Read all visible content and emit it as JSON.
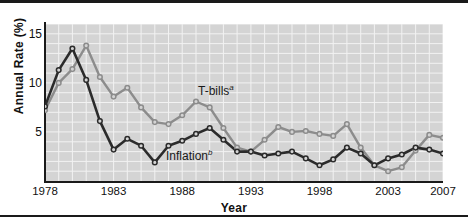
{
  "figure": {
    "background": "#ffffff",
    "plot_background": "#d4d4d4",
    "grid_color": "#f2f2f2"
  },
  "annotations": {
    "tbills": {
      "text": "T-bills",
      "sup": "a",
      "x": 198,
      "y": 80
    },
    "inflation": {
      "text": "Inflation",
      "sup": "b",
      "x": 166,
      "y": 145
    }
  },
  "chart_data": {
    "type": "line",
    "title": "",
    "xlabel": "Year",
    "ylabel": "Annual Rate (%)",
    "xlim": [
      1978,
      2007
    ],
    "ylim": [
      0,
      16
    ],
    "yticks": [
      5,
      10,
      15
    ],
    "xticks": [
      1978,
      1983,
      1988,
      1993,
      1998,
      2003,
      2007
    ],
    "grid": true,
    "legend": "inline-annotations",
    "x": [
      1978,
      1979,
      1980,
      1981,
      1982,
      1983,
      1984,
      1985,
      1986,
      1987,
      1988,
      1989,
      1990,
      1991,
      1992,
      1993,
      1994,
      1995,
      1996,
      1997,
      1998,
      1999,
      2000,
      2001,
      2002,
      2003,
      2004,
      2005,
      2006,
      2007
    ],
    "series": [
      {
        "name": "T-bills",
        "color": "#8c8c8c",
        "marker": "circle",
        "values": [
          7.2,
          10.0,
          11.4,
          13.8,
          10.6,
          8.6,
          9.5,
          7.5,
          6.0,
          5.8,
          6.7,
          8.1,
          7.5,
          5.4,
          3.4,
          3.0,
          4.2,
          5.5,
          5.0,
          5.1,
          4.8,
          4.6,
          5.8,
          3.4,
          1.6,
          1.0,
          1.4,
          3.1,
          4.7,
          4.4
        ]
      },
      {
        "name": "Inflation",
        "color": "#2b2b2b",
        "marker": "circle",
        "values": [
          7.6,
          11.3,
          13.5,
          10.3,
          6.1,
          3.2,
          4.3,
          3.6,
          1.9,
          3.6,
          4.1,
          4.8,
          5.4,
          4.2,
          3.0,
          3.0,
          2.6,
          2.8,
          3.0,
          2.3,
          1.6,
          2.2,
          3.4,
          2.8,
          1.6,
          2.3,
          2.7,
          3.4,
          3.2,
          2.8
        ]
      }
    ]
  }
}
